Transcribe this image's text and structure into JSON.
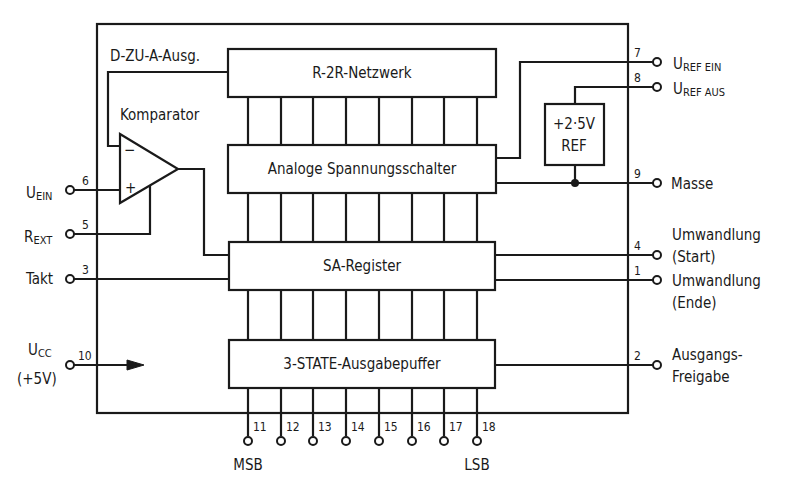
{
  "diagram": {
    "blocks": {
      "r2r": "R-2R-Netzwerk",
      "switches": "Analoge Spannungsschalter",
      "sar": "SA-Register",
      "buffer": "3-STATE-Ausgabepuffer",
      "ref_line1": "+2·5V",
      "ref_line2": "REF"
    },
    "internal_labels": {
      "dac_out": "D-ZU-A-Ausg.",
      "comparator": "Komparator",
      "comp_minus": "−",
      "comp_plus": "+"
    },
    "left_pins": [
      {
        "num": "6",
        "label_main": "U",
        "label_sub": "EIN"
      },
      {
        "num": "5",
        "label_main": "R",
        "label_sub": "EXT"
      },
      {
        "num": "3",
        "label_main": "Takt",
        "label_sub": ""
      },
      {
        "num": "10",
        "label_main": "U",
        "label_sub": "CC",
        "label_extra": "(+5V)"
      }
    ],
    "right_pins": [
      {
        "num": "7",
        "label_main": "U",
        "label_sub": "REF EIN"
      },
      {
        "num": "8",
        "label_main": "U",
        "label_sub": "REF AUS"
      },
      {
        "num": "9",
        "label_main": "Masse"
      },
      {
        "num": "4",
        "label_line1": "Umwandlung",
        "label_line2": "(Start)"
      },
      {
        "num": "1",
        "label_line1": "Umwandlung",
        "label_line2": "(Ende)"
      },
      {
        "num": "2",
        "label_line1": "Ausgangs-",
        "label_line2": "Freigabe"
      }
    ],
    "bottom_pins": [
      "11",
      "12",
      "13",
      "14",
      "15",
      "16",
      "17",
      "18"
    ],
    "bottom_labels": {
      "msb": "MSB",
      "lsb": "LSB"
    }
  }
}
